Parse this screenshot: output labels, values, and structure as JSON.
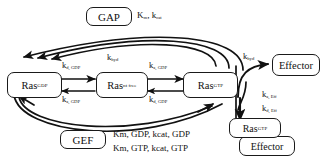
{
  "diagram": {
    "type": "biochemical-reaction-scheme",
    "stroke_color": "#111111",
    "background": "#ffffff"
  },
  "nodes": {
    "gap": {
      "label": "GAP"
    },
    "gef": {
      "label": "GEF"
    },
    "ras_gdp": {
      "name": "Ras",
      "state": "GDP"
    },
    "ras_nt_free": {
      "name": "Ras",
      "state": "nt free"
    },
    "ras_gtp": {
      "name": "Ras",
      "state": "GTP"
    },
    "effector": {
      "label": "Effector"
    },
    "complex_ras_gtp": {
      "name": "Ras",
      "state": "GTP"
    },
    "complex_effector": {
      "label": "Effector"
    }
  },
  "rate_labels": {
    "gap_constants": {
      "k": "K",
      "sub1": "m",
      "k2": "k",
      "sub2": "cat",
      "full": "Km, kcat"
    },
    "gef_line1": {
      "full": "Km, GDP, kcat, GDP"
    },
    "gef_line2": {
      "full": "Km, GTP, kcat, GTP"
    },
    "kd_gdp_top_left": {
      "base": "k",
      "sub": "d, GDP"
    },
    "ka_gdp_bottom_left": {
      "base": "k",
      "sub": "a, GDP"
    },
    "ka_gdp_top_right": {
      "base": "k",
      "sub": "a, GDP"
    },
    "kd_gdp_bottom_right": {
      "base": "k",
      "sub": "d, GDP"
    },
    "khyd_center": {
      "base": "k",
      "sub": "hyd"
    },
    "khyd_right": {
      "base": "k",
      "sub": "hyd"
    },
    "ka_eff": {
      "base": "k",
      "sub": "a, Eff"
    },
    "kd_eff": {
      "base": "k",
      "sub": "d, Eff"
    }
  }
}
